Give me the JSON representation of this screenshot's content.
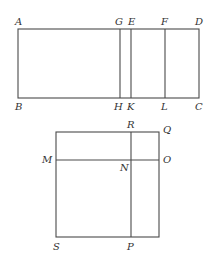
{
  "figure_1": {
    "description": "Rectangle ABCD divided by vertical lines GH, EK, FL",
    "labels": {
      "A": "A",
      "G": "G",
      "E": "E",
      "F": "F",
      "D": "D",
      "B": "B",
      "H": "H",
      "K": "K",
      "L": "L",
      "C": "C"
    }
  },
  "figure_2": {
    "description": "Square SQ divided by horizontal line MO and vertical line RP meeting at N",
    "labels": {
      "R": "R",
      "Q": "Q",
      "M": "M",
      "N": "N",
      "O": "O",
      "S": "S",
      "P": "P"
    }
  },
  "colors": {
    "line": "#4a4a4a",
    "text": "#333333",
    "background": "#ffffff"
  }
}
